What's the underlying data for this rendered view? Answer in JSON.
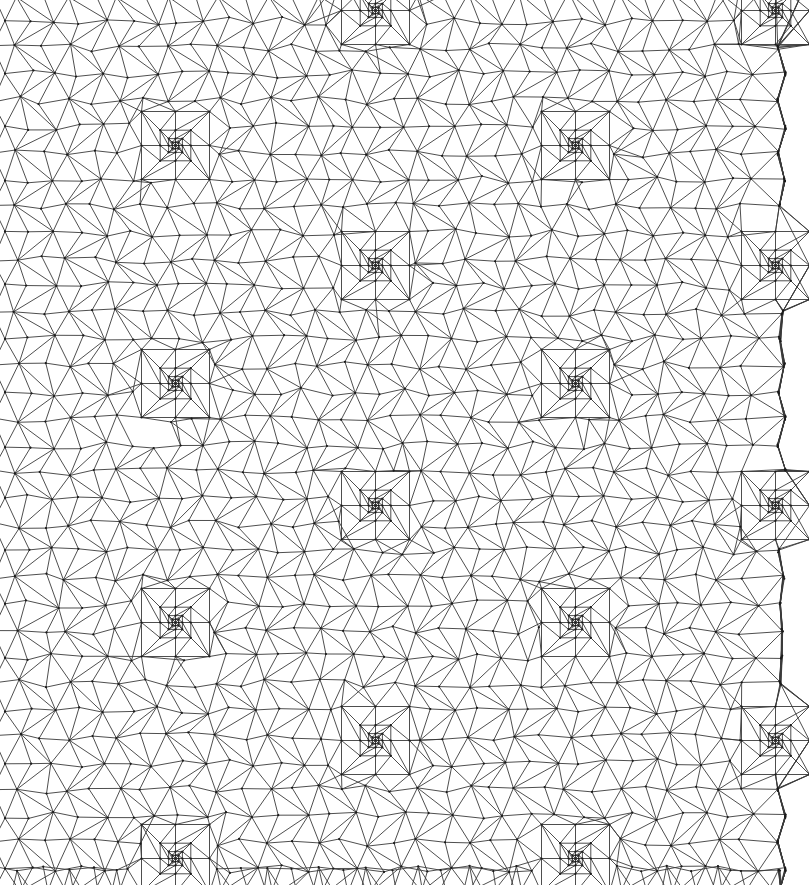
{
  "figure": {
    "kind": "triangular-finite-element-mesh",
    "title": "",
    "width": 809,
    "height": 885,
    "background_color": "#ffffff",
    "edge_color": "#3a3a3a",
    "edge_width": 0.9,
    "vertex_color": "#1a1a1a",
    "vertex_radius": 1.1
  },
  "mesh": {
    "domain": {
      "x_min": -8,
      "x_max": 781,
      "y_min": -6,
      "y_max": 868,
      "boundary_style": "wavy-jagged",
      "boundary_amplitude": 5,
      "clipped_edges": [
        "left",
        "top"
      ]
    },
    "base_grid": {
      "type": "perturbed-triangular-lattice",
      "cell_size_x": 25.0,
      "cell_size_y": 26.5,
      "jitter": 4.2,
      "diagonal_pattern": "alternating"
    },
    "refinement": {
      "levels": 4,
      "scheme": "nested-concentric-squares",
      "shrink_factor": 0.45,
      "outer_half_size": 34,
      "center_spacing_x": 200,
      "center_spacing_y": 238,
      "row_offset_x": 200,
      "centers": [
        {
          "x": 375,
          "y": 10,
          "level": 4
        },
        {
          "x": 775,
          "y": 10,
          "level": 4
        },
        {
          "x": 175,
          "y": 145,
          "level": 4
        },
        {
          "x": 575,
          "y": 145,
          "level": 4
        },
        {
          "x": 375,
          "y": 265,
          "level": 4
        },
        {
          "x": 775,
          "y": 265,
          "level": 4
        },
        {
          "x": 175,
          "y": 383,
          "level": 4
        },
        {
          "x": 575,
          "y": 383,
          "level": 4
        },
        {
          "x": 375,
          "y": 505,
          "level": 4
        },
        {
          "x": 775,
          "y": 505,
          "level": 4
        },
        {
          "x": 175,
          "y": 622,
          "level": 4
        },
        {
          "x": 575,
          "y": 622,
          "level": 4
        },
        {
          "x": 375,
          "y": 740,
          "level": 4
        },
        {
          "x": 775,
          "y": 740,
          "level": 4
        },
        {
          "x": 175,
          "y": 858,
          "level": 4
        },
        {
          "x": 575,
          "y": 858,
          "level": 4
        }
      ]
    },
    "statistics": {
      "approx_vertices": 1850,
      "approx_triangles": 3550,
      "approx_edges": 5400
    }
  },
  "chart_data": {
    "type": "mesh",
    "title": "",
    "xlabel": "",
    "ylabel": "",
    "xlim": [
      -8,
      781
    ],
    "ylim": [
      -6,
      868
    ],
    "grid": false,
    "legend": null,
    "series": [
      {
        "name": "mesh edges",
        "color": "#3a3a3a",
        "count": 5400
      },
      {
        "name": "mesh vertices",
        "color": "#1a1a1a",
        "count": 1850
      }
    ]
  }
}
